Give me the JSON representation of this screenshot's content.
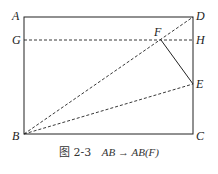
{
  "figure": {
    "caption_prefix": "图 2-3",
    "caption_math": "AB → AB(F)",
    "points": {
      "A": {
        "label": "A",
        "x": 24,
        "y": 17
      },
      "B": {
        "label": "B",
        "x": 24,
        "y": 134
      },
      "C": {
        "label": "C",
        "x": 193,
        "y": 134
      },
      "D": {
        "label": "D",
        "x": 193,
        "y": 17
      },
      "E": {
        "label": "E",
        "x": 193,
        "y": 84
      },
      "F": {
        "label": "F",
        "x": 161,
        "y": 40
      },
      "G": {
        "label": "G",
        "x": 24,
        "y": 40
      },
      "H": {
        "label": "H",
        "x": 193,
        "y": 40
      }
    },
    "segments": {
      "solid": [
        "AD",
        "DC",
        "CB",
        "BA",
        "FE"
      ],
      "dashed": [
        "GH",
        "BD",
        "BE"
      ]
    }
  }
}
